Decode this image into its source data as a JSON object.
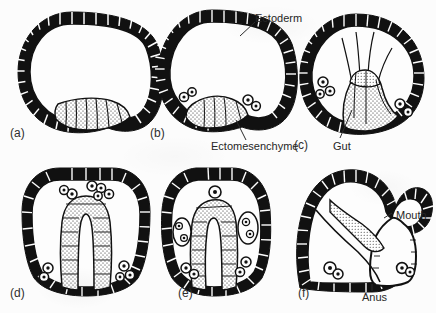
{
  "figure": {
    "background_color": "#fcfcfc",
    "ink_color": "#111111",
    "label_color": "#262626"
  },
  "panels": [
    {
      "id": "a",
      "letter": "(a)",
      "x": 10,
      "y": 127,
      "description": "Blastula with thickened vegetal plate of ectomesenchyme cells"
    },
    {
      "id": "b",
      "letter": "(b)",
      "x": 150,
      "y": 127,
      "description": "Primary mesenchyme cells ingressing into the blastocoel"
    },
    {
      "id": "c",
      "letter": "(c)",
      "x": 294,
      "y": 139,
      "description": "Archenteron invaginating with filopodial extensions to the animal pole"
    },
    {
      "id": "d",
      "letter": "(d)",
      "x": 10,
      "y": 287,
      "description": "Elongating archenteron forming an inverted U shape"
    },
    {
      "id": "e",
      "letter": "(e)",
      "x": 178,
      "y": 287,
      "description": "Gut tube lengthening with coelomic pouches"
    },
    {
      "id": "f",
      "letter": "(f)",
      "x": 298,
      "y": 287,
      "description": "Pluteus stage with a complete through-gut"
    }
  ],
  "callouts": [
    {
      "name": "ectoderm",
      "text": "Ectoderm",
      "x": 255,
      "y": 13
    },
    {
      "name": "ectomesenchyme",
      "text": "Ectomesenchyme",
      "x": 211,
      "y": 141
    },
    {
      "name": "gut",
      "text": "Gut",
      "x": 333,
      "y": 141
    },
    {
      "name": "mouth",
      "text": "Mouth",
      "x": 396,
      "y": 210
    },
    {
      "name": "anus",
      "text": "Anus",
      "x": 362,
      "y": 292
    }
  ]
}
